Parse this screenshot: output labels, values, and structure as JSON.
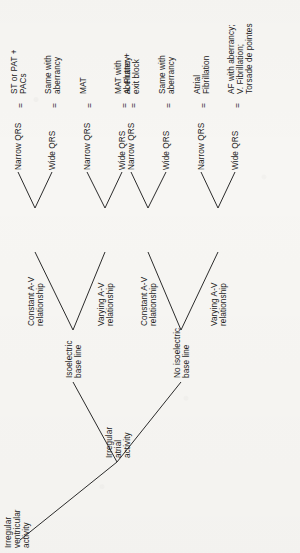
{
  "diagram": {
    "type": "decision-tree",
    "orientation": "rotated-90-ccw",
    "title_text": "Irregular ventricular activity",
    "equals_symbol": "=",
    "root": {
      "id": "root",
      "lines": [
        "Irregular",
        "ventricular",
        "activity"
      ]
    },
    "level2": {
      "id": "irregular-atrial-activity",
      "lines": [
        "Irregular",
        "atrial",
        "activity"
      ]
    },
    "level3": [
      {
        "id": "isoelectric-base-line",
        "lines": [
          "Isoelectric",
          "base line"
        ]
      },
      {
        "id": "no-isoelectric-base-line",
        "lines": [
          "No isoelectric",
          "base line"
        ]
      }
    ],
    "level4": [
      {
        "id": "constant-av-1",
        "lines": [
          "Constant A-V",
          "relationship"
        ]
      },
      {
        "id": "varying-av-1",
        "lines": [
          "Varying A-V",
          "relationship"
        ]
      },
      {
        "id": "constant-av-2",
        "lines": [
          "Constant A-V",
          "relationship"
        ]
      },
      {
        "id": "varying-av-2",
        "lines": [
          "Varying A-V",
          "relationship"
        ]
      }
    ],
    "leaves": [
      {
        "id": "leaf-1",
        "qrs": "Narrow QRS",
        "result": [
          "ST or PAT +",
          "PACs"
        ]
      },
      {
        "id": "leaf-2",
        "qrs": "Wide QRS",
        "result": [
          "Same with",
          "aberrancy"
        ]
      },
      {
        "id": "leaf-3",
        "qrs": "Narrow QRS",
        "result": [
          "MAT"
        ]
      },
      {
        "id": "leaf-4",
        "qrs": "Wide QRS",
        "result": [
          "MAT with",
          "aberrancy"
        ]
      },
      {
        "id": "leaf-5",
        "qrs": "Narrow QRS",
        "result": [
          "A. Flutter +",
          "exit block"
        ]
      },
      {
        "id": "leaf-6",
        "qrs": "Wide QRS",
        "result": [
          "Same with",
          "aberrancy"
        ]
      },
      {
        "id": "leaf-7",
        "qrs": "Narrow QRS",
        "result": [
          "Atrial",
          "Fibrillation"
        ]
      },
      {
        "id": "leaf-8",
        "qrs": "Wide QRS",
        "result": [
          "AF with aberrancy;",
          "V. Fibrillation;",
          "Torsade de pointes"
        ]
      }
    ],
    "colors": {
      "ink": "#222222",
      "paper": "#f7f6f3",
      "line": "#2b2b2b"
    }
  }
}
